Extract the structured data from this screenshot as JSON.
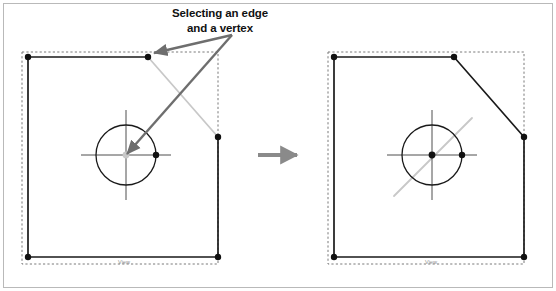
{
  "figure": {
    "domain": "Diagram",
    "width": 556,
    "height": 291,
    "caption": {
      "line1": "Selecting an edge",
      "line2": "and a vertex",
      "full_text": "Selecting an edge and a vertex"
    },
    "colors": {
      "outline": "#1a1a1a",
      "selection_highlight": "#c8c8c8",
      "annotation_arrow": "#6e6e6e",
      "transition_arrow": "#8a8a8a",
      "dashed_bounds": "#7a7a7a",
      "frame_border": "#b9b9b9",
      "background": "#ffffff",
      "view_label": "#8d8d8d"
    }
  },
  "panels": [
    {
      "id": "before",
      "name": "left-panel",
      "role": "before-state",
      "view_label": "View",
      "description": "Sketch with an edge and a vertex highlighted as selected",
      "bounding_box": {
        "x": 22,
        "y": 52,
        "width": 196,
        "height": 212
      },
      "shape": {
        "type": "polyline-with-chamfer",
        "vertices": [
          {
            "name": "top-left",
            "x": 28,
            "y": 57,
            "selected": false
          },
          {
            "name": "top-right",
            "x": 148,
            "y": 57,
            "selected": false
          },
          {
            "name": "chamfer-right",
            "x": 218,
            "y": 137,
            "selected": false
          },
          {
            "name": "bottom-right",
            "x": 218,
            "y": 257,
            "selected": false
          },
          {
            "name": "bottom-left",
            "x": 28,
            "y": 257,
            "selected": false
          }
        ],
        "edges": [
          {
            "from": "top-left",
            "to": "top-right",
            "state": "normal"
          },
          {
            "from": "top-right",
            "to": "chamfer-right",
            "state": "selected"
          },
          {
            "from": "chamfer-right",
            "to": "bottom-right",
            "state": "normal"
          },
          {
            "from": "bottom-right",
            "to": "bottom-left",
            "state": "normal"
          },
          {
            "from": "bottom-left",
            "to": "top-left",
            "state": "normal"
          }
        ]
      },
      "circle": {
        "center": {
          "x": 126,
          "y": 155
        },
        "radius": 30,
        "center_point_state": "selected",
        "quadrant_point": {
          "x": 156,
          "y": 155,
          "state": "normal"
        },
        "crosshair_extent": 45
      },
      "annotations": [
        {
          "name": "arrow-to-edge",
          "from": {
            "x": 232,
            "y": 35
          },
          "to": {
            "x": 154,
            "y": 53
          },
          "target": "selected-edge"
        },
        {
          "name": "arrow-to-vertex",
          "from": {
            "x": 232,
            "y": 35
          },
          "to": {
            "x": 127,
            "y": 154
          },
          "target": "selected-vertex"
        }
      ]
    },
    {
      "id": "after",
      "name": "right-panel",
      "role": "after-state",
      "view_label": "View",
      "description": "Same sketch after selection, chamfer edge drawn solid and a construction line shown",
      "bounding_box": {
        "x": 328,
        "y": 52,
        "width": 196,
        "height": 212
      },
      "shape": {
        "type": "polyline-with-chamfer",
        "vertices": [
          {
            "name": "top-left",
            "x": 334,
            "y": 57,
            "selected": false
          },
          {
            "name": "top-right",
            "x": 454,
            "y": 57,
            "selected": false
          },
          {
            "name": "chamfer-right",
            "x": 524,
            "y": 137,
            "selected": false
          },
          {
            "name": "bottom-right",
            "x": 524,
            "y": 257,
            "selected": false
          },
          {
            "name": "bottom-left",
            "x": 334,
            "y": 257,
            "selected": false
          }
        ],
        "edges": [
          {
            "from": "top-left",
            "to": "top-right",
            "state": "normal"
          },
          {
            "from": "top-right",
            "to": "chamfer-right",
            "state": "normal"
          },
          {
            "from": "chamfer-right",
            "to": "bottom-right",
            "state": "normal"
          },
          {
            "from": "bottom-right",
            "to": "bottom-left",
            "state": "normal"
          },
          {
            "from": "bottom-left",
            "to": "top-left",
            "state": "normal"
          }
        ]
      },
      "circle": {
        "center": {
          "x": 432,
          "y": 155
        },
        "radius": 30,
        "center_point_state": "normal",
        "quadrant_point": {
          "x": 462,
          "y": 155,
          "state": "normal"
        },
        "crosshair_extent": 45
      },
      "construction_line": {
        "name": "diagonal-construction-line",
        "from": {
          "x": 394,
          "y": 196
        },
        "to": {
          "x": 472,
          "y": 118
        },
        "state": "selected"
      }
    }
  ],
  "transition": {
    "name": "transition-arrow",
    "direction": "right",
    "from": {
      "x": 258,
      "y": 155
    },
    "to": {
      "x": 300,
      "y": 155
    }
  }
}
